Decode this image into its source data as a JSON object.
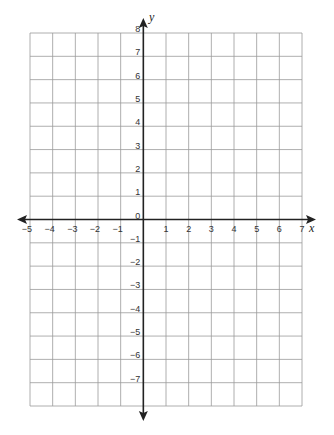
{
  "chart_data": {
    "type": "coordinate-grid",
    "title": "",
    "xlabel": "x",
    "ylabel": "y",
    "xlim": [
      -5,
      7
    ],
    "ylim": [
      -8,
      8
    ],
    "grid": true,
    "x_tick_labels": [
      "−5",
      "−4",
      "−3",
      "−2",
      "−1",
      "1",
      "2",
      "3",
      "4",
      "5",
      "6",
      "7"
    ],
    "x_tick_values": [
      -5,
      -4,
      -3,
      -2,
      -1,
      1,
      2,
      3,
      4,
      5,
      6,
      7
    ],
    "y_tick_labels": [
      "8",
      "7",
      "6",
      "5",
      "4",
      "3",
      "2",
      "1",
      "0",
      "−1",
      "−2",
      "−3",
      "−4",
      "−5",
      "−6",
      "−7"
    ],
    "y_tick_values": [
      8,
      7,
      6,
      5,
      4,
      3,
      2,
      1,
      0,
      -1,
      -2,
      -3,
      -4,
      -5,
      -6,
      -7
    ],
    "origin_label": "0",
    "series": []
  },
  "colors": {
    "grid": "#9a9a9a",
    "axis": "#222222",
    "background": "#ffffff"
  }
}
